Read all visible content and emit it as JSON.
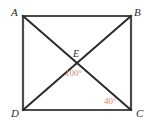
{
  "figure": {
    "kind": "rectangle-with-diagonals",
    "background_color": "#ffffff",
    "stroke_color": "#4a4a4a",
    "diagonal_color": "#2b2b2b",
    "angle_color": "#d9836b",
    "vertices": [
      {
        "id": "A",
        "label": "A",
        "x": 23,
        "y": 16,
        "label_x": 11,
        "label_y": 7
      },
      {
        "id": "B",
        "label": "B",
        "x": 131,
        "y": 16,
        "label_x": 134,
        "label_y": 7
      },
      {
        "id": "C",
        "label": "C",
        "x": 131,
        "y": 110,
        "label_x": 136,
        "label_y": 108
      },
      {
        "id": "D",
        "label": "D",
        "x": 23,
        "y": 110,
        "label_x": 11,
        "label_y": 108
      }
    ],
    "intersection": {
      "id": "E",
      "label": "E",
      "x": 77,
      "y": 63,
      "label_x": 73,
      "label_y": 49
    },
    "sides": [
      {
        "id": "AB",
        "from": "A",
        "to": "B"
      },
      {
        "id": "BC",
        "from": "B",
        "to": "C"
      },
      {
        "id": "CD",
        "from": "C",
        "to": "D"
      },
      {
        "id": "DA",
        "from": "D",
        "to": "A"
      }
    ],
    "diagonals": [
      {
        "id": "AC",
        "from": "A",
        "to": "C"
      },
      {
        "id": "BD",
        "from": "B",
        "to": "D"
      }
    ],
    "angles": [
      {
        "id": "angle-DEC",
        "label": "100°",
        "value": 100,
        "unit": "degrees",
        "at_vertex": "E",
        "label_x": 65,
        "label_y": 69
      },
      {
        "id": "angle-ACD",
        "label": "40°",
        "value": 40,
        "unit": "degrees",
        "at_vertex": "C",
        "label_x": 104,
        "label_y": 97
      }
    ]
  }
}
